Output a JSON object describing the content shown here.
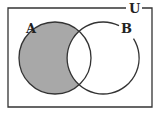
{
  "diagram": {
    "type": "venn",
    "universe_label": "U",
    "sets": [
      {
        "label": "A",
        "cx": 55,
        "cy": 58,
        "r": 36
      },
      {
        "label": "B",
        "cx": 103,
        "cy": 58,
        "r": 36
      }
    ],
    "shaded_region": "A only (A minus B)",
    "colors": {
      "line": "#333333",
      "shade": "#a8a8a8",
      "background": "#ffffff"
    }
  }
}
